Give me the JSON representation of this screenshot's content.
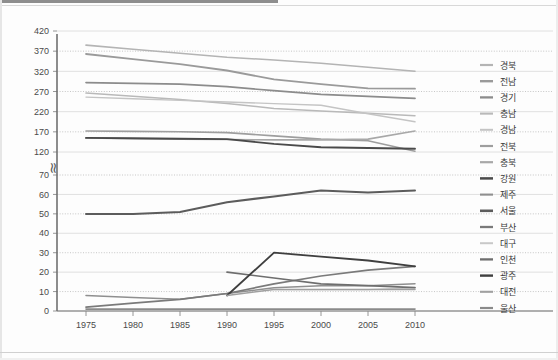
{
  "chart_data": {
    "type": "line",
    "title": "",
    "xlabel": "",
    "ylabel": "",
    "x": [
      1975,
      1980,
      1985,
      1990,
      1995,
      2000,
      2005,
      2010
    ],
    "xtick_labels": [
      "1975",
      "1980",
      "1985",
      "1990",
      "1995",
      "2000",
      "2005",
      "2010"
    ],
    "ytick_labels": [
      "0",
      "10",
      "20",
      "30",
      "40",
      "50",
      "60",
      "70",
      "120",
      "170",
      "220",
      "270",
      "320",
      "370",
      "420"
    ],
    "ytick_values": [
      0,
      10,
      20,
      30,
      40,
      50,
      60,
      70,
      120,
      170,
      220,
      270,
      320,
      370,
      420
    ],
    "y_axis_break": {
      "present": true,
      "between": [
        70,
        120
      ],
      "symbol": "≈"
    },
    "ylim": [
      0,
      420
    ],
    "grid": "horizontal-dotted-and-solid",
    "legend_position": "right",
    "series": [
      {
        "name": "경북",
        "color": "#b4b4b4",
        "width": 1.6,
        "values": [
          385,
          375,
          365,
          355,
          348,
          340,
          330,
          320
        ]
      },
      {
        "name": "전남",
        "color": "#9a9a9a",
        "width": 1.8,
        "values": [
          363,
          350,
          338,
          322,
          300,
          288,
          278,
          277
        ]
      },
      {
        "name": "경기",
        "color": "#8c8c8c",
        "width": 1.7,
        "values": [
          292,
          290,
          288,
          282,
          272,
          263,
          258,
          253
        ]
      },
      {
        "name": "충남",
        "color": "#b9b9b9",
        "width": 1.5,
        "values": [
          266,
          258,
          250,
          240,
          228,
          222,
          216,
          210
        ]
      },
      {
        "name": "경남",
        "color": "#c4c4c4",
        "width": 1.4,
        "values": [
          256,
          252,
          248,
          244,
          240,
          236,
          215,
          195
        ]
      },
      {
        "name": "전북",
        "color": "#9e9e9e",
        "width": 1.6,
        "values": [
          172,
          171,
          170,
          168,
          160,
          152,
          148,
          122
        ]
      },
      {
        "name": "충북",
        "color": "#a8a8a8",
        "width": 1.6,
        "values": [
          155,
          153,
          152,
          151,
          150,
          150,
          152,
          172
        ]
      },
      {
        "name": "강원",
        "color": "#4a4a4a",
        "width": 1.9,
        "values": [
          155,
          154,
          153,
          152,
          140,
          132,
          130,
          128
        ]
      },
      {
        "name": "제주",
        "color": "#8f8f8f",
        "width": 1.5,
        "values": [
          8,
          7,
          6,
          9,
          12,
          13,
          13,
          14
        ]
      },
      {
        "name": "서울",
        "color": "#5c5c5c",
        "width": 2.0,
        "values": [
          50,
          50,
          51,
          56,
          59,
          62,
          61,
          62
        ]
      },
      {
        "name": "부산",
        "color": "#7a7a7a",
        "width": 1.7,
        "values": [
          2,
          4,
          6,
          9,
          14,
          18,
          21,
          23
        ]
      },
      {
        "name": "대구",
        "color": "#c8c8c8",
        "width": 1.4,
        "values": [
          0,
          0,
          0,
          0,
          11,
          11,
          11,
          12
        ]
      },
      {
        "name": "인천",
        "color": "#6e6e6e",
        "width": 1.7,
        "values": [
          0,
          0,
          0,
          20,
          17,
          14,
          13,
          12
        ]
      },
      {
        "name": "광주",
        "color": "#3f3f3f",
        "width": 1.8,
        "values": [
          0,
          0,
          0,
          8,
          30,
          28,
          26,
          23
        ]
      },
      {
        "name": "대전",
        "color": "#a0a0a0",
        "width": 1.5,
        "values": [
          0,
          0,
          0,
          8,
          11,
          11,
          11,
          11
        ]
      },
      {
        "name": "울산",
        "color": "#8a8a8a",
        "width": 1.6,
        "values": [
          1,
          1,
          1,
          1,
          1,
          1,
          1,
          1
        ]
      }
    ]
  }
}
